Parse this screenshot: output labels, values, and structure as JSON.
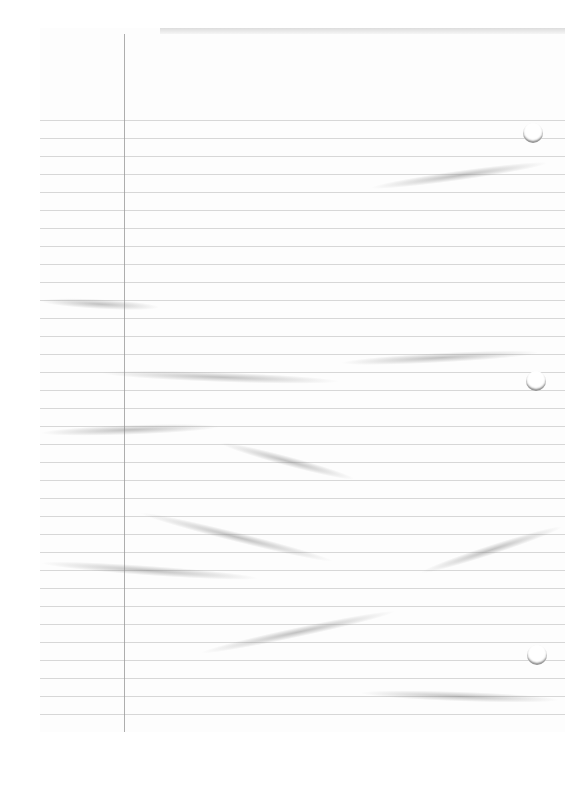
{
  "image": {
    "subject": "blank crumpled lined notebook paper (scanned)",
    "background_color": "#ffffff",
    "paper_color": "#fdfdfd",
    "rule_color": "#c9c9c9",
    "margin_line_color": "#9a9a9a",
    "crease_color": "#787878"
  },
  "paper": {
    "rule_count": 34,
    "rule_start_y": 92,
    "rule_spacing": 18,
    "margin_line_x": 84,
    "punch_holes": [
      {
        "x": 483,
        "y": 95
      },
      {
        "x": 486,
        "y": 343
      },
      {
        "x": 487,
        "y": 617
      }
    ],
    "creases": [
      {
        "x": 330,
        "y": 155,
        "w": 180,
        "angle": -8
      },
      {
        "x": 60,
        "y": 340,
        "w": 240,
        "angle": 2
      },
      {
        "x": 300,
        "y": 330,
        "w": 200,
        "angle": -3
      },
      {
        "x": 0,
        "y": 268,
        "w": 120,
        "angle": 3
      },
      {
        "x": 0,
        "y": 400,
        "w": 180,
        "angle": -2
      },
      {
        "x": 180,
        "y": 410,
        "w": 140,
        "angle": 15
      },
      {
        "x": 0,
        "y": 530,
        "w": 220,
        "angle": 4
      },
      {
        "x": 160,
        "y": 620,
        "w": 200,
        "angle": -12
      },
      {
        "x": 320,
        "y": 660,
        "w": 200,
        "angle": 2
      },
      {
        "x": 100,
        "y": 480,
        "w": 200,
        "angle": 14
      },
      {
        "x": 380,
        "y": 540,
        "w": 150,
        "angle": -18
      }
    ]
  }
}
